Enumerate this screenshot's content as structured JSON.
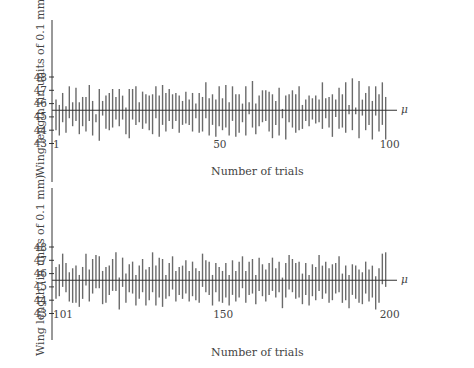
{
  "chart_data": [
    {
      "type": "interval",
      "title": "",
      "xlabel": "Number of trials",
      "ylabel": "Wing length (in units of 0.1 mm)",
      "reference_line": {
        "label": "μ",
        "value": 45.5
      },
      "yticks": [
        43,
        44,
        45,
        46,
        47,
        48
      ],
      "xtick_labels": [
        {
          "trial": 1,
          "label": "1"
        },
        {
          "trial": 50,
          "label": "50"
        },
        {
          "trial": 100,
          "label": "100"
        }
      ],
      "x_range": [
        1,
        100
      ],
      "intervals_lower": [
        44.0,
        43.6,
        44.6,
        43.8,
        44.9,
        44.3,
        44.7,
        43.7,
        44.3,
        43.9,
        44.7,
        43.6,
        44.6,
        43.2,
        45.1,
        44.1,
        44.0,
        44.2,
        44.8,
        44.3,
        44.8,
        43.7,
        43.4,
        44.8,
        44.4,
        44.6,
        44.1,
        44.5,
        44.0,
        43.7,
        44.9,
        43.5,
        44.4,
        43.9,
        44.7,
        44.1,
        44.7,
        43.8,
        44.4,
        44.5,
        44.4,
        43.9,
        44.9,
        43.8,
        43.9,
        44.9,
        43.6,
        44.4,
        43.5,
        44.3,
        44.0,
        44.2,
        43.6,
        44.7,
        43.5,
        43.8,
        44.6,
        43.6,
        45.2,
        44.2,
        43.7,
        44.3,
        44.6,
        44.7,
        43.9,
        43.4,
        44.4,
        43.6,
        44.9,
        43.3,
        44.6,
        44.2,
        43.8,
        44.0,
        44.1,
        44.7,
        44.3,
        44.8,
        44.5,
        44.6,
        44.1,
        44.9,
        44.2,
        43.5,
        45.0,
        44.1,
        44.2,
        43.8,
        45.2,
        44.0,
        45.2,
        43.4,
        45.1,
        44.0,
        44.4,
        43.3,
        45.1,
        43.9,
        44.4,
        43.3
      ],
      "intervals_upper": [
        46.3,
        45.9,
        46.8,
        45.8,
        47.3,
        46.1,
        47.2,
        46.1,
        46.5,
        46.5,
        47.4,
        46.2,
        45.2,
        47.1,
        46.2,
        46.6,
        46.8,
        47.1,
        46.5,
        47.1,
        46.6,
        45.7,
        47.1,
        47.1,
        47.3,
        46.1,
        46.9,
        46.7,
        46.6,
        46.7,
        47.3,
        46.6,
        47.4,
        46.8,
        47.1,
        46.7,
        46.8,
        46.6,
        46.2,
        46.9,
        46.3,
        46.8,
        46.0,
        46.8,
        46.5,
        47.6,
        46.4,
        46.7,
        46.3,
        47.3,
        46.4,
        47.4,
        46.1,
        47.3,
        46.7,
        46.7,
        46.0,
        47.3,
        46.1,
        47.7,
        46.0,
        46.6,
        47.0,
        47.0,
        46.9,
        46.7,
        46.2,
        47.2,
        45.6,
        46.6,
        46.7,
        47.0,
        46.7,
        47.3,
        45.9,
        46.3,
        46.6,
        46.4,
        46.6,
        46.3,
        47.6,
        46.4,
        46.5,
        46.7,
        46.3,
        47.2,
        46.7,
        47.6,
        45.9,
        47.9,
        45.7,
        47.7,
        46.3,
        46.8,
        47.3,
        46.2,
        47.3,
        46.7,
        47.6,
        46.5
      ]
    },
    {
      "type": "interval",
      "title": "",
      "xlabel": "Number of trials",
      "ylabel": "Wing length (in units of 0.1 mm)",
      "reference_line": {
        "label": "μ",
        "value": 45.5
      },
      "yticks": [
        43,
        44,
        45,
        46,
        47,
        48
      ],
      "xtick_labels": [
        {
          "trial": 101,
          "label": "101"
        },
        {
          "trial": 150,
          "label": "150"
        },
        {
          "trial": 200,
          "label": "200"
        }
      ],
      "x_range": [
        101,
        200
      ],
      "intervals_lower": [
        44.1,
        44.3,
        45.0,
        44.6,
        43.9,
        43.8,
        43.8,
        43.5,
        44.1,
        45.1,
        43.9,
        44.5,
        44.9,
        44.9,
        43.7,
        43.8,
        44.4,
        44.7,
        44.7,
        43.3,
        45.0,
        43.8,
        44.6,
        44.5,
        43.6,
        44.1,
        44.6,
        43.6,
        44.0,
        44.6,
        43.6,
        44.2,
        43.5,
        44.1,
        44.3,
        44.8,
        43.9,
        44.4,
        44.1,
        44.5,
        43.9,
        44.3,
        44.0,
        43.8,
        45.0,
        44.6,
        44.4,
        43.6,
        44.6,
        43.9,
        43.8,
        44.2,
        43.6,
        44.4,
        43.9,
        44.2,
        44.9,
        43.8,
        44.4,
        44.5,
        43.7,
        44.7,
        44.3,
        43.9,
        44.4,
        44.7,
        44.2,
        44.6,
        43.4,
        44.2,
        44.8,
        44.6,
        44.1,
        44.2,
        43.7,
        44.4,
        43.6,
        44.3,
        44.0,
        44.7,
        44.1,
        44.5,
        43.8,
        44.0,
        44.5,
        44.6,
        43.8,
        44.0,
        43.4,
        44.4,
        44.1,
        43.8,
        43.7,
        44.5,
        43.9,
        44.2,
        43.3,
        43.8,
        45.2,
        45.0
      ],
      "intervals_upper": [
        46.5,
        46.7,
        47.5,
        46.8,
        46.1,
        46.4,
        46.6,
        45.9,
        46.5,
        47.5,
        46.3,
        47.1,
        47.4,
        47.3,
        46.2,
        46.5,
        46.6,
        47.1,
        47.6,
        45.7,
        47.2,
        46.0,
        46.7,
        46.9,
        45.9,
        46.6,
        47.1,
        46.3,
        46.5,
        47.6,
        46.6,
        47.2,
        47.1,
        45.9,
        46.8,
        47.3,
        46.2,
        46.5,
        46.6,
        47.0,
        46.2,
        46.9,
        46.4,
        46.2,
        47.5,
        47.0,
        46.9,
        45.9,
        46.8,
        46.5,
        46.2,
        46.8,
        45.9,
        47.0,
        46.2,
        46.9,
        47.3,
        46.2,
        46.9,
        47.1,
        45.9,
        47.2,
        46.7,
        46.3,
        46.8,
        47.2,
        46.4,
        46.9,
        45.7,
        46.8,
        47.4,
        47.1,
        46.8,
        46.9,
        46.0,
        46.8,
        45.9,
        46.7,
        46.5,
        47.4,
        46.6,
        46.9,
        46.4,
        46.7,
        46.8,
        47.3,
        46.0,
        46.6,
        45.9,
        46.7,
        46.6,
        46.3,
        46.1,
        46.9,
        46.3,
        46.6,
        45.8,
        46.4,
        47.5,
        47.6
      ]
    }
  ],
  "panels": {
    "top": {
      "xlabel": "Number of trials",
      "ylabel": "Wing length (in units of 0.1 mm)",
      "mu_label": "μ"
    },
    "bottom": {
      "xlabel": "Number of trials",
      "ylabel": "Wing length (in units of 0.1 mm)",
      "mu_label": "μ"
    }
  },
  "colors": {
    "bar": "#6a6a6a",
    "axis": "#333333",
    "text": "#444444",
    "background": "#ffffff"
  }
}
